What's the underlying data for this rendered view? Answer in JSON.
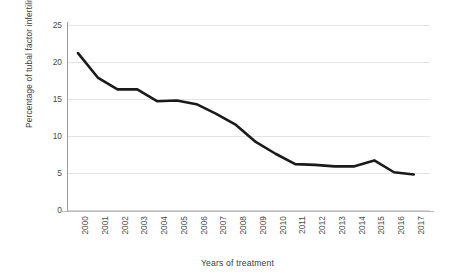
{
  "chart_data": {
    "type": "line",
    "title": "",
    "xlabel": "Years of treatment",
    "ylabel": "Percentage of tubal factor infertility",
    "categories": [
      "2000",
      "2001",
      "2002",
      "2003",
      "2004",
      "2005",
      "2006",
      "2007",
      "2008",
      "2009",
      "2010",
      "2011",
      "2012",
      "2013",
      "2014",
      "2015",
      "2016",
      "2017"
    ],
    "series": [
      {
        "name": "Percentage of tubal factor infertility",
        "values": [
          21.2,
          17.9,
          16.3,
          16.3,
          14.7,
          14.8,
          14.3,
          13.0,
          11.5,
          9.2,
          7.6,
          6.2,
          6.1,
          5.9,
          5.9,
          6.7,
          5.1,
          4.8
        ]
      }
    ],
    "ylim": [
      0,
      25
    ],
    "yticks": [
      0,
      5,
      10,
      15,
      20,
      25
    ],
    "ytick_labels": [
      "0",
      "5",
      "10",
      "15",
      "20",
      "25"
    ],
    "grid": true,
    "legend": "none",
    "line_color": "#1a1a1a",
    "grid_color": "#e3e3e3",
    "axis_color": "#9a9a9a",
    "background": "#ffffff"
  }
}
